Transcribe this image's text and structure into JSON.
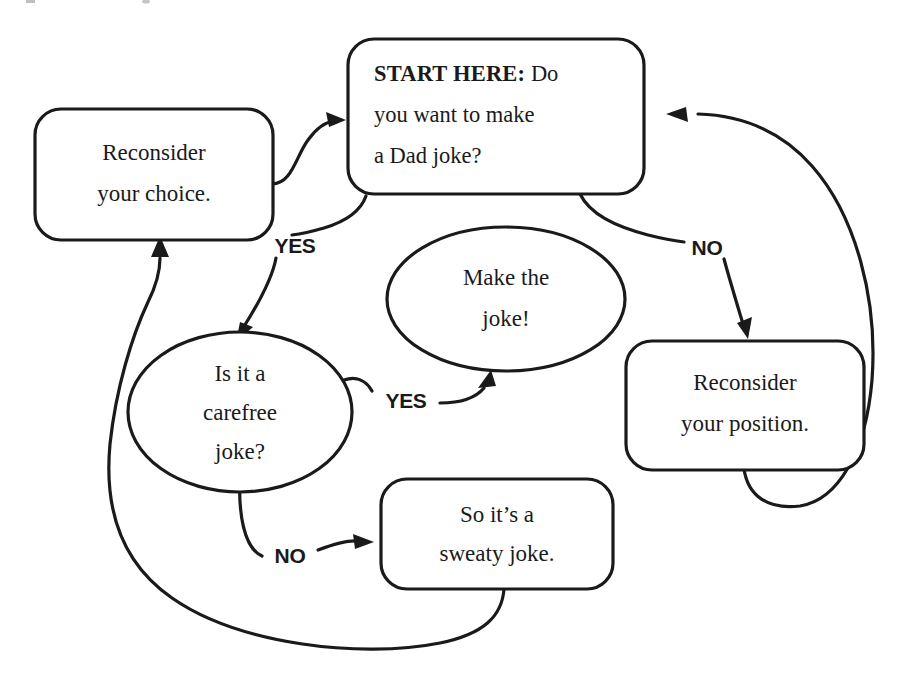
{
  "diagram": {
    "background_color": "#ffffff",
    "ink_color": "#1a1a1a"
  },
  "nodes": {
    "start": {
      "shape": "rounded-rectangle",
      "label_bold": "START HERE:",
      "line1_rest": " Do",
      "line2": "you want to make",
      "line3": "a Dad joke?"
    },
    "reconsider_choice": {
      "shape": "rounded-rectangle",
      "line1": "Reconsider",
      "line2": "your choice."
    },
    "reconsider_position": {
      "shape": "rounded-rectangle",
      "line1": "Reconsider",
      "line2": "your position."
    },
    "make_the_joke": {
      "shape": "ellipse",
      "line1": "Make the",
      "line2": "joke!"
    },
    "carefree_question": {
      "shape": "ellipse",
      "line1": "Is it a",
      "line2": "carefree",
      "line3": "joke?"
    },
    "sweaty_joke": {
      "shape": "rounded-rectangle",
      "line1": "So it’s a",
      "line2": "sweaty joke."
    }
  },
  "edges": {
    "start_yes": {
      "label": "YES",
      "from": "start",
      "to": "carefree_question"
    },
    "start_no": {
      "label": "NO",
      "from": "start",
      "to": "reconsider_position"
    },
    "carefree_yes": {
      "label": "YES",
      "from": "carefree_question",
      "to": "make_the_joke"
    },
    "carefree_no": {
      "label": "NO",
      "from": "carefree_question",
      "to": "sweaty_joke"
    },
    "choice_to_start": {
      "label": "",
      "from": "reconsider_choice",
      "to": "start"
    },
    "position_to_start": {
      "label": "",
      "from": "reconsider_position",
      "to": "start"
    },
    "sweaty_to_choice": {
      "label": "",
      "from": "sweaty_joke",
      "to": "reconsider_choice"
    }
  }
}
